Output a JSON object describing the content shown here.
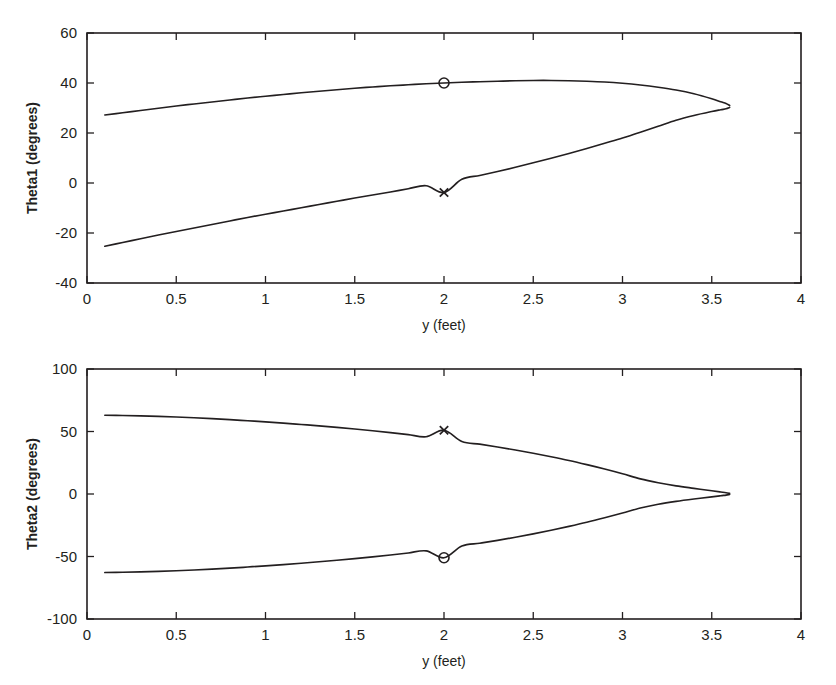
{
  "page": {
    "background_color": "#ffffff",
    "ink_color": "#231f20",
    "width": 836,
    "height": 685
  },
  "chart_data": [
    {
      "type": "line",
      "id": "theta1",
      "title": "",
      "xlabel": "y (feet)",
      "ylabel": "Theta1 (degrees)",
      "xlim": [
        0,
        4
      ],
      "ylim": [
        -40,
        60
      ],
      "xticks": [
        0,
        0.5,
        1,
        1.5,
        2,
        2.5,
        3,
        3.5,
        4
      ],
      "xticklabels": [
        "0",
        "0.5",
        "1",
        "1.5",
        "2",
        "2.5",
        "3",
        "3.5",
        "4"
      ],
      "yticks": [
        -40,
        -20,
        0,
        20,
        40,
        60
      ],
      "yticklabels": [
        "-40",
        "-20",
        "0",
        "20",
        "40",
        "60"
      ],
      "grid": false,
      "legend": null,
      "frame": "box",
      "tick_direction": "in",
      "series": [
        {
          "name": "Theta1 upper branch",
          "x": [
            0.1,
            0.2,
            0.3,
            0.4,
            0.5,
            0.6,
            0.7,
            0.8,
            0.9,
            1.0,
            1.1,
            1.2,
            1.3,
            1.4,
            1.5,
            1.6,
            1.7,
            1.8,
            1.9,
            2.0,
            2.1,
            2.2,
            2.3,
            2.4,
            2.5,
            2.6,
            2.7,
            2.8,
            2.9,
            3.0,
            3.1,
            3.2,
            3.3,
            3.4,
            3.5,
            3.55,
            3.58,
            3.6
          ],
          "values": [
            27.2,
            28.1,
            29.0,
            29.9,
            30.8,
            31.6,
            32.4,
            33.2,
            34.0,
            34.7,
            35.4,
            36.1,
            36.7,
            37.3,
            37.9,
            38.4,
            38.9,
            39.3,
            39.7,
            40.0,
            40.3,
            40.5,
            40.7,
            40.9,
            41.0,
            41.0,
            40.9,
            40.7,
            40.4,
            39.9,
            39.2,
            38.3,
            37.2,
            35.7,
            33.7,
            32.5,
            31.8,
            31.0
          ]
        },
        {
          "name": "Theta1 lower branch",
          "x": [
            0.1,
            0.2,
            0.3,
            0.4,
            0.5,
            0.6,
            0.7,
            0.8,
            0.9,
            1.0,
            1.1,
            1.2,
            1.3,
            1.4,
            1.5,
            1.6,
            1.7,
            1.8,
            1.9,
            2.0,
            2.1,
            2.2,
            2.3,
            2.4,
            2.5,
            2.6,
            2.7,
            2.8,
            2.9,
            3.0,
            3.1,
            3.2,
            3.3,
            3.4,
            3.5,
            3.55,
            3.58,
            3.6
          ],
          "values": [
            -25.3,
            -23.8,
            -22.3,
            -20.8,
            -19.4,
            -18.0,
            -16.6,
            -15.2,
            -13.8,
            -12.5,
            -11.2,
            -9.9,
            -8.6,
            -7.3,
            -6.0,
            -4.8,
            -3.6,
            -2.3,
            -1.1,
            -3.8,
            1.5,
            3.0,
            4.6,
            6.3,
            8.1,
            9.9,
            11.8,
            13.8,
            15.9,
            18.0,
            20.3,
            22.7,
            25.1,
            27.0,
            28.6,
            29.3,
            29.7,
            30.2
          ]
        }
      ],
      "markers": [
        {
          "symbol": "circle",
          "name": "theta1-circle-marker",
          "x": 2.0,
          "y": 40.0
        },
        {
          "symbol": "cross",
          "name": "theta1-cross-marker",
          "x": 2.0,
          "y": -3.8
        }
      ]
    },
    {
      "type": "line",
      "id": "theta2",
      "title": "",
      "xlabel": "y (feet)",
      "ylabel": "Theta2 (degrees)",
      "xlim": [
        0,
        4
      ],
      "ylim": [
        -100,
        100
      ],
      "xticks": [
        0,
        0.5,
        1,
        1.5,
        2,
        2.5,
        3,
        3.5,
        4
      ],
      "xticklabels": [
        "0",
        "0.5",
        "1",
        "1.5",
        "2",
        "2.5",
        "3",
        "3.5",
        "4"
      ],
      "yticks": [
        -100,
        -50,
        0,
        50,
        100
      ],
      "yticklabels": [
        "-100",
        "-50",
        "0",
        "50",
        "100"
      ],
      "grid": false,
      "legend": null,
      "frame": "box",
      "tick_direction": "in",
      "series": [
        {
          "name": "Theta2 upper branch",
          "x": [
            0.1,
            0.2,
            0.3,
            0.4,
            0.5,
            0.6,
            0.7,
            0.8,
            0.9,
            1.0,
            1.1,
            1.2,
            1.3,
            1.4,
            1.5,
            1.6,
            1.7,
            1.8,
            1.9,
            2.0,
            2.1,
            2.2,
            2.3,
            2.4,
            2.5,
            2.6,
            2.7,
            2.8,
            2.9,
            3.0,
            3.1,
            3.2,
            3.3,
            3.4,
            3.5,
            3.55,
            3.58,
            3.6
          ],
          "values": [
            63.0,
            62.8,
            62.5,
            62.1,
            61.6,
            61.0,
            60.3,
            59.5,
            58.6,
            57.7,
            56.7,
            55.6,
            54.5,
            53.3,
            52.0,
            50.6,
            49.1,
            47.5,
            45.8,
            51.0,
            42.0,
            39.9,
            37.6,
            35.2,
            32.6,
            29.8,
            26.8,
            23.5,
            20.0,
            16.2,
            12.1,
            9.0,
            6.5,
            4.5,
            2.6,
            1.6,
            1.0,
            0.5
          ]
        },
        {
          "name": "Theta2 lower branch",
          "x": [
            0.1,
            0.2,
            0.3,
            0.4,
            0.5,
            0.6,
            0.7,
            0.8,
            0.9,
            1.0,
            1.1,
            1.2,
            1.3,
            1.4,
            1.5,
            1.6,
            1.7,
            1.8,
            1.9,
            2.0,
            2.1,
            2.2,
            2.3,
            2.4,
            2.5,
            2.6,
            2.7,
            2.8,
            2.9,
            3.0,
            3.1,
            3.2,
            3.3,
            3.4,
            3.5,
            3.55,
            3.58,
            3.6
          ],
          "values": [
            -62.8,
            -62.6,
            -62.3,
            -61.9,
            -61.4,
            -60.8,
            -60.1,
            -59.3,
            -58.4,
            -57.5,
            -56.5,
            -55.4,
            -54.2,
            -53.0,
            -51.7,
            -50.3,
            -48.8,
            -47.2,
            -45.5,
            -51.0,
            -41.6,
            -39.4,
            -37.1,
            -34.6,
            -31.9,
            -29.0,
            -25.9,
            -22.6,
            -19.0,
            -15.2,
            -11.2,
            -8.2,
            -5.9,
            -4.0,
            -2.3,
            -1.4,
            -0.9,
            -0.4
          ]
        }
      ],
      "markers": [
        {
          "symbol": "cross",
          "name": "theta2-cross-marker",
          "x": 2.0,
          "y": 51.0
        },
        {
          "symbol": "circle",
          "name": "theta2-circle-marker",
          "x": 2.0,
          "y": -51.0
        }
      ]
    }
  ]
}
